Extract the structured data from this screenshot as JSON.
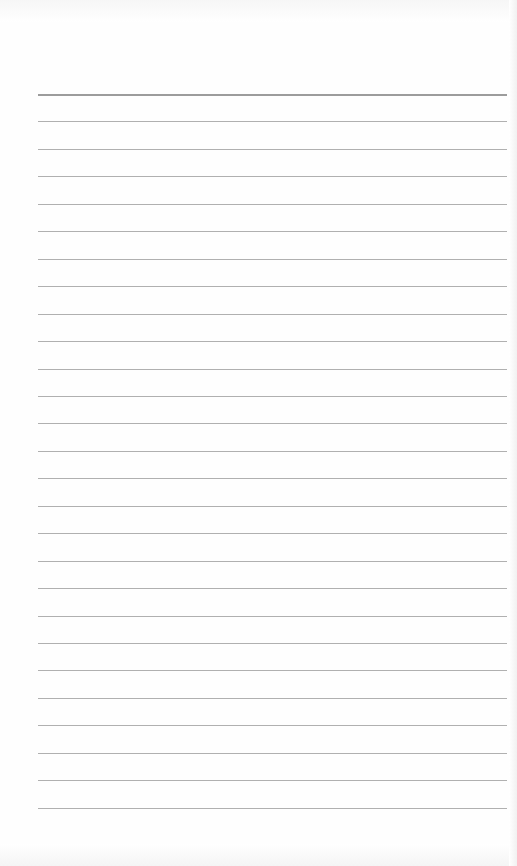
{
  "page": {
    "type": "lined-paper",
    "background_color": "#ffffff",
    "rule_color": "#b0b0b0",
    "header_rule_color": "#9c9c9c",
    "rule_left_px": 38,
    "rule_right_px": 507,
    "first_rule_y": 94,
    "rule_spacing_px": 27.45,
    "rule_count": 27
  }
}
